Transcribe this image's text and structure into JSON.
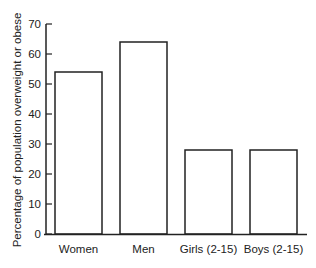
{
  "chart_data": {
    "type": "bar",
    "title": "",
    "xlabel": "",
    "ylabel": "Percentage of population overweight or obese",
    "categories": [
      "Women",
      "Men",
      "Girls (2-15)",
      "Boys (2-15)"
    ],
    "values": [
      54,
      64,
      28,
      28
    ],
    "ylim": [
      0,
      70
    ],
    "yticks": [
      0,
      10,
      20,
      30,
      40,
      50,
      60,
      70
    ],
    "grid": false,
    "legend": null
  },
  "colors": {
    "bar_fill": "#ffffff",
    "bar_stroke": "#222222",
    "axis": "#222222"
  }
}
